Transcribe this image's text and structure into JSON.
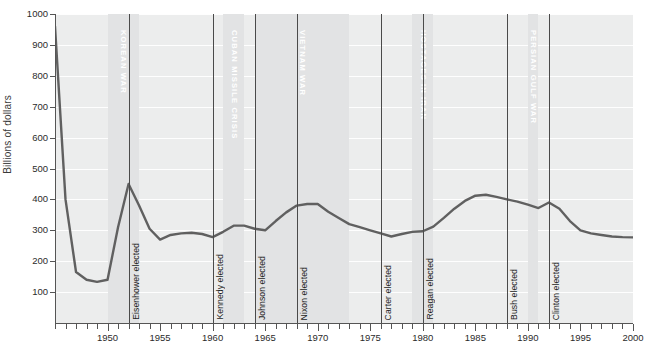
{
  "chart_data": {
    "type": "line",
    "title": "",
    "xlabel": "",
    "ylabel": "Billions of dollars",
    "xlim": [
      1945,
      2000
    ],
    "ylim": [
      0,
      1000
    ],
    "grid": "horizontal",
    "legend": "none",
    "y_ticks": [
      100,
      200,
      300,
      400,
      500,
      600,
      700,
      800,
      900,
      1000
    ],
    "x_ticks": [
      1950,
      1955,
      1960,
      1965,
      1970,
      1975,
      1980,
      1985,
      1990,
      1995,
      2000
    ],
    "x": [
      1945,
      1946,
      1947,
      1948,
      1949,
      1950,
      1951,
      1952,
      1953,
      1954,
      1955,
      1956,
      1957,
      1958,
      1959,
      1960,
      1961,
      1962,
      1963,
      1964,
      1965,
      1966,
      1967,
      1968,
      1969,
      1970,
      1971,
      1972,
      1973,
      1974,
      1975,
      1976,
      1977,
      1978,
      1979,
      1980,
      1981,
      1982,
      1983,
      1984,
      1985,
      1986,
      1987,
      1988,
      1989,
      1990,
      1991,
      1992,
      1993,
      1994,
      1995,
      1996,
      1997,
      1998,
      1999,
      2000
    ],
    "values": [
      960,
      400,
      165,
      140,
      133,
      140,
      310,
      450,
      380,
      305,
      270,
      285,
      290,
      292,
      288,
      278,
      295,
      315,
      315,
      305,
      300,
      330,
      358,
      380,
      385,
      385,
      360,
      340,
      320,
      310,
      300,
      290,
      280,
      288,
      295,
      297,
      312,
      340,
      370,
      395,
      412,
      415,
      408,
      400,
      393,
      383,
      372,
      390,
      370,
      330,
      300,
      290,
      285,
      280,
      278,
      277
    ],
    "series": [
      {
        "name": "Defense spending",
        "color": "#606060",
        "values": [
          960,
          400,
          165,
          140,
          133,
          140,
          310,
          450,
          380,
          305,
          270,
          285,
          290,
          292,
          288,
          278,
          295,
          315,
          315,
          305,
          300,
          330,
          358,
          380,
          385,
          385,
          360,
          340,
          320,
          310,
          300,
          290,
          280,
          288,
          295,
          297,
          312,
          340,
          370,
          395,
          412,
          415,
          408,
          400,
          393,
          383,
          372,
          390,
          370,
          330,
          300,
          290,
          285,
          280,
          278,
          277
        ]
      }
    ],
    "war_bands": [
      {
        "label": "KOREAN WAR",
        "start": 1950,
        "end": 1953
      },
      {
        "label": "CUBAN MISSILE CRISIS",
        "start": 1961,
        "end": 1963
      },
      {
        "label": "VIETNAM WAR",
        "start": 1964,
        "end": 1973
      },
      {
        "label": "HOSTAGES IN IRAN",
        "start": 1979,
        "end": 1981
      },
      {
        "label": "PERSIAN GULF WAR",
        "start": 1990,
        "end": 1991
      }
    ],
    "event_lines": [
      {
        "label": "Eisenhower elected",
        "year": 1952
      },
      {
        "label": "Kennedy elected",
        "year": 1960
      },
      {
        "label": "Johnson elected",
        "year": 1964
      },
      {
        "label": "Nixon elected",
        "year": 1968
      },
      {
        "label": "Carter elected",
        "year": 1976
      },
      {
        "label": "Reagan elected",
        "year": 1980
      },
      {
        "label": "Bush elected",
        "year": 1988
      },
      {
        "label": "Clinton elected",
        "year": 1992
      }
    ],
    "colors": {
      "plot_background": "#eceded",
      "band_background": "#e2e3e4",
      "gridline": "#ffffff",
      "line": "#606060",
      "axis": "#555555",
      "text": "#2b2b2b",
      "war_label": "#ffffff"
    }
  }
}
